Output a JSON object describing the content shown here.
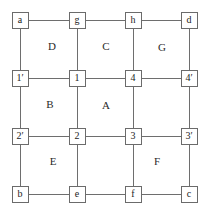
{
  "diagram": {
    "type": "grid-graph",
    "title": "",
    "geometry": {
      "width": 208,
      "height": 217,
      "columns_x": [
        20,
        77,
        133,
        189
      ],
      "rows_y": [
        20,
        78,
        136,
        194
      ],
      "node_size": 17,
      "line_color": "#6e6e6e",
      "node_border_color": "#6b6b6b",
      "node_fill": "#ffffff",
      "text_color": "#1c1c1c",
      "background": "#ffffff"
    },
    "nodes": [
      {
        "id": "a",
        "label": "a",
        "col": 0,
        "row": 0
      },
      {
        "id": "g",
        "label": "g",
        "col": 1,
        "row": 0
      },
      {
        "id": "h",
        "label": "h",
        "col": 2,
        "row": 0
      },
      {
        "id": "d",
        "label": "d",
        "col": 3,
        "row": 0
      },
      {
        "id": "1p",
        "label": "1′",
        "col": 0,
        "row": 1
      },
      {
        "id": "1",
        "label": "1",
        "col": 1,
        "row": 1
      },
      {
        "id": "4",
        "label": "4",
        "col": 2,
        "row": 1
      },
      {
        "id": "4p",
        "label": "4′",
        "col": 3,
        "row": 1
      },
      {
        "id": "2p",
        "label": "2′",
        "col": 0,
        "row": 2
      },
      {
        "id": "2",
        "label": "2",
        "col": 1,
        "row": 2
      },
      {
        "id": "3",
        "label": "3",
        "col": 2,
        "row": 2
      },
      {
        "id": "3p",
        "label": "3′",
        "col": 3,
        "row": 2
      },
      {
        "id": "b",
        "label": "b",
        "col": 0,
        "row": 3
      },
      {
        "id": "e",
        "label": "e",
        "col": 1,
        "row": 3
      },
      {
        "id": "f",
        "label": "f",
        "col": 2,
        "row": 3
      },
      {
        "id": "c",
        "label": "c",
        "col": 3,
        "row": 3
      }
    ],
    "edges": [
      {
        "from": "a",
        "to": "g",
        "orientation": "horizontal"
      },
      {
        "from": "g",
        "to": "h",
        "orientation": "horizontal"
      },
      {
        "from": "h",
        "to": "d",
        "orientation": "horizontal"
      },
      {
        "from": "1p",
        "to": "1",
        "orientation": "horizontal"
      },
      {
        "from": "1",
        "to": "4",
        "orientation": "horizontal"
      },
      {
        "from": "4",
        "to": "4p",
        "orientation": "horizontal"
      },
      {
        "from": "2p",
        "to": "2",
        "orientation": "horizontal"
      },
      {
        "from": "2",
        "to": "3",
        "orientation": "horizontal"
      },
      {
        "from": "3",
        "to": "3p",
        "orientation": "horizontal"
      },
      {
        "from": "b",
        "to": "e",
        "orientation": "horizontal"
      },
      {
        "from": "e",
        "to": "f",
        "orientation": "horizontal"
      },
      {
        "from": "f",
        "to": "c",
        "orientation": "horizontal"
      },
      {
        "from": "a",
        "to": "1p",
        "orientation": "vertical"
      },
      {
        "from": "1p",
        "to": "2p",
        "orientation": "vertical"
      },
      {
        "from": "2p",
        "to": "b",
        "orientation": "vertical"
      },
      {
        "from": "g",
        "to": "1",
        "orientation": "vertical"
      },
      {
        "from": "1",
        "to": "2",
        "orientation": "vertical"
      },
      {
        "from": "2",
        "to": "e",
        "orientation": "vertical"
      },
      {
        "from": "h",
        "to": "4",
        "orientation": "vertical"
      },
      {
        "from": "4",
        "to": "3",
        "orientation": "vertical"
      },
      {
        "from": "3",
        "to": "f",
        "orientation": "vertical"
      },
      {
        "from": "d",
        "to": "4p",
        "orientation": "vertical"
      },
      {
        "from": "4p",
        "to": "3p",
        "orientation": "vertical"
      },
      {
        "from": "3p",
        "to": "c",
        "orientation": "vertical"
      }
    ],
    "region_labels": [
      {
        "id": "region-d",
        "label": "D",
        "x": 52,
        "y": 46
      },
      {
        "id": "region-c",
        "label": "C",
        "x": 106,
        "y": 46
      },
      {
        "id": "region-g",
        "label": "G",
        "x": 162,
        "y": 47
      },
      {
        "id": "region-b",
        "label": "B",
        "x": 50,
        "y": 104
      },
      {
        "id": "region-a",
        "label": "A",
        "x": 106,
        "y": 105
      },
      {
        "id": "region-e",
        "label": "E",
        "x": 53,
        "y": 161
      },
      {
        "id": "region-f",
        "label": "F",
        "x": 157,
        "y": 161
      }
    ]
  }
}
